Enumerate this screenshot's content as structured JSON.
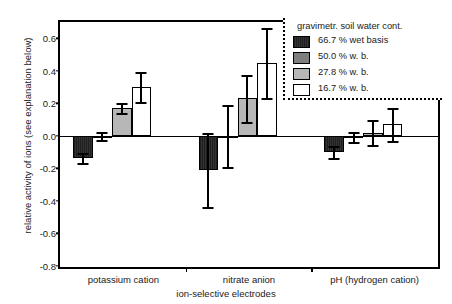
{
  "chart_data": {
    "type": "bar",
    "title": "",
    "xlabel": "ion-selective electrodes",
    "ylabel": "relative activity of ions (see explanation below)",
    "ylim": [
      -0.8,
      0.7
    ],
    "yticks": [
      0.6,
      0.4,
      0.2,
      0.0,
      -0.2,
      -0.4,
      -0.6,
      -0.8
    ],
    "ytick_labels": [
      "0.6",
      "0.4",
      "0.2",
      "0.0",
      "-0.2",
      "-0.4",
      "-0.6",
      "-0.8"
    ],
    "grid": false,
    "legend_position": "top-right",
    "legend_title": "gravimetr. soil water cont.",
    "categories": [
      "potassium cation",
      "nitrate anion",
      "pH (hydrogen cation)"
    ],
    "series": [
      {
        "name": "66.7 % wet basis",
        "color": "#2b2b2b",
        "values": [
          -0.135,
          -0.21,
          -0.1
        ],
        "errors": [
          0.03,
          0.23,
          0.035
        ]
      },
      {
        "name": "50.0 % w. b.",
        "color": "#7e7e7e",
        "values": [
          0.0,
          0.0,
          -0.005
        ],
        "errors": [
          0.025,
          0.19,
          0.03
        ]
      },
      {
        "name": "27.8 % w. b.",
        "color": "#b7b7b7",
        "values": [
          0.17,
          0.23,
          0.02
        ],
        "errors": [
          0.03,
          0.145,
          0.075
        ]
      },
      {
        "name": "16.7 % w. b.",
        "color": "#ffffff",
        "values": [
          0.3,
          0.45,
          0.07
        ],
        "errors": [
          0.09,
          0.215,
          0.1
        ]
      }
    ]
  },
  "legend": {
    "title": "gravimetr. soil water cont.",
    "items": [
      {
        "label": "66.7 % wet basis",
        "swatch": "#2b2b2b"
      },
      {
        "label": "50.0 % w. b.",
        "swatch": "#7e7e7e"
      },
      {
        "label": "27.8 % w. b.",
        "swatch": "#b7b7b7"
      },
      {
        "label": "16.7 % w. b.",
        "swatch": "#ffffff"
      }
    ]
  },
  "axes": {
    "y_title": "relative activity of ions (see explanation below)",
    "x_title": "ion-selective electrodes",
    "x_categories": [
      "potassium cation",
      "nitrate anion",
      "pH (hydrogen cation)"
    ]
  }
}
